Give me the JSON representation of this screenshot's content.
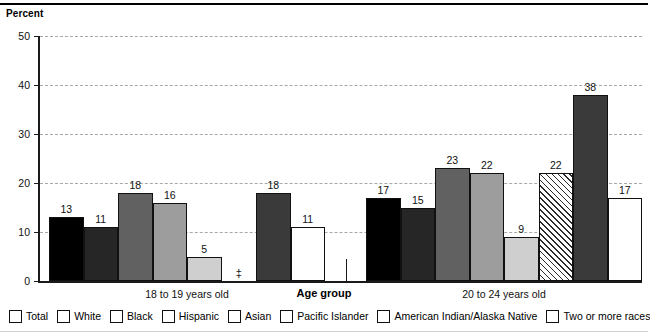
{
  "axis_title_y": "Percent",
  "axis_title_x": "Age group",
  "suppressed_symbol": "‡",
  "chart_data": {
    "type": "bar",
    "title": "",
    "xlabel": "Age group",
    "ylabel": "Percent",
    "ylim": [
      0,
      50
    ],
    "yticks": [
      "0",
      "10",
      "20",
      "30",
      "40",
      "50"
    ],
    "grid": true,
    "legend_position": "bottom",
    "categories": [
      "18 to 19 years old",
      "20 to 24 years old"
    ],
    "series": [
      {
        "name": "Total",
        "color": "#000000",
        "pattern": "solid",
        "values": [
          13,
          17
        ],
        "labels": [
          "13",
          "17"
        ]
      },
      {
        "name": "White",
        "color": "#262626",
        "pattern": "solid",
        "values": [
          11,
          15
        ],
        "labels": [
          "11",
          "15"
        ]
      },
      {
        "name": "Black",
        "color": "#616161",
        "pattern": "solid",
        "values": [
          18,
          23
        ],
        "labels": [
          "18",
          "23"
        ]
      },
      {
        "name": "Hispanic",
        "color": "#9d9d9d",
        "pattern": "solid",
        "values": [
          16,
          22
        ],
        "labels": [
          "16",
          "22"
        ]
      },
      {
        "name": "Asian",
        "color": "#cfcfcf",
        "pattern": "solid",
        "values": [
          5,
          9
        ],
        "labels": [
          "5",
          "9"
        ]
      },
      {
        "name": "Pacific Islander",
        "color": "#ffffff",
        "pattern": "diagonal",
        "values": [
          null,
          22
        ],
        "labels": [
          "‡",
          "22"
        ]
      },
      {
        "name": "American Indian/Alaska Native",
        "color": "#3a3a3a",
        "pattern": "solid",
        "values": [
          18,
          38
        ],
        "labels": [
          "18",
          "38"
        ]
      },
      {
        "name": "Two or more races",
        "color": "#ffffff",
        "pattern": "solid",
        "values": [
          11,
          17
        ],
        "labels": [
          "11",
          "17"
        ]
      }
    ]
  },
  "legend": {
    "items": [
      {
        "label": "Total"
      },
      {
        "label": "White"
      },
      {
        "label": "Black"
      },
      {
        "label": "Hispanic"
      },
      {
        "label": "Asian"
      },
      {
        "label": "Pacific Islander"
      },
      {
        "label": "American Indian/Alaska Native"
      },
      {
        "label": "Two or more races"
      }
    ]
  }
}
